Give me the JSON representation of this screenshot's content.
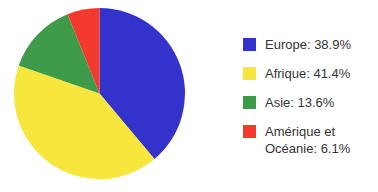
{
  "chart_data": {
    "type": "pie",
    "title": "",
    "categories": [
      "Europe",
      "Afrique",
      "Asie",
      "Amérique et Océanie"
    ],
    "values": [
      38.9,
      41.4,
      13.6,
      6.1
    ],
    "unit": "%",
    "start_angle_deg": 0,
    "direction": "clockwise",
    "legend_position": "right",
    "grid": false,
    "colors": [
      "#3333cc",
      "#f7e63c",
      "#3d9b4a",
      "#f4392e"
    ],
    "background": "#ffffff",
    "text_color": "#333333",
    "slices": [
      {
        "label": "Europe",
        "value": 38.9,
        "color": "#3333cc",
        "legend_text": "Europe: 38.9%"
      },
      {
        "label": "Afrique",
        "value": 41.4,
        "color": "#f7e63c",
        "legend_text": "Afrique: 41.4%"
      },
      {
        "label": "Asie",
        "value": 13.6,
        "color": "#3d9b4a",
        "legend_text": "Asie: 13.6%"
      },
      {
        "label": "Amérique et Océanie",
        "value": 6.1,
        "color": "#f4392e",
        "legend_text": "Amérique et\nOcéanie: 6.1%"
      }
    ]
  },
  "legend": {
    "items": [
      {
        "label": "Europe: 38.9%",
        "color": "#3333cc"
      },
      {
        "label": "Afrique: 41.4%",
        "color": "#f7e63c"
      },
      {
        "label": "Asie: 13.6%",
        "color": "#3d9b4a"
      },
      {
        "label": "Amérique et\nOcéanie: 6.1%",
        "color": "#f4392e"
      }
    ]
  }
}
